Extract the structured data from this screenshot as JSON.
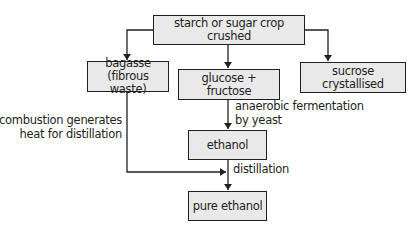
{
  "diagram": {
    "type": "flowchart",
    "nodes": {
      "crop": {
        "line1": "starch or sugar crop crushed"
      },
      "bagasse": {
        "line1": "bagasse",
        "line2": "(fibrous waste)"
      },
      "glucose": {
        "line1": "glucose + fructose"
      },
      "sucrose": {
        "line1": "sucrose crystallised"
      },
      "ethanol": {
        "line1": "ethanol"
      },
      "pure": {
        "line1": "pure ethanol"
      }
    },
    "edge_labels": {
      "fermentation": {
        "line1": "anaerobic fermentation",
        "line2": "by yeast"
      },
      "combustion": {
        "line1": "combustion generates",
        "line2": "heat for distillation"
      },
      "distillation": {
        "line1": "distillation"
      }
    },
    "edges": [
      {
        "from": "crop",
        "to": "bagasse"
      },
      {
        "from": "crop",
        "to": "glucose"
      },
      {
        "from": "crop",
        "to": "sucrose"
      },
      {
        "from": "glucose",
        "to": "ethanol",
        "label": "fermentation"
      },
      {
        "from": "ethanol",
        "to": "pure",
        "label": "distillation"
      },
      {
        "from": "bagasse",
        "to": "distillation",
        "label": "combustion"
      }
    ],
    "colors": {
      "box_fill": "#e9e9e9",
      "stroke": "#231f20"
    }
  }
}
